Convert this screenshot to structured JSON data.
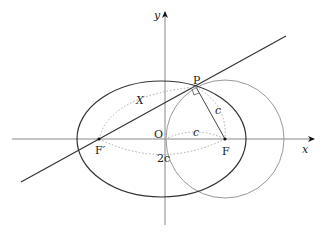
{
  "diagram": {
    "type": "ellipse-focal-geometry",
    "axes": {
      "x_label": "x",
      "y_label": "y",
      "origin_label": "O"
    },
    "points": {
      "P": "P",
      "F": "F",
      "F_prime": "F′"
    },
    "annotations": {
      "X": "X",
      "c_PF": "c",
      "c_OF": "c",
      "two_c": "2c"
    },
    "colors": {
      "ellipse": "#333333",
      "circle": "#888888",
      "axes": "#777777",
      "line": "#333333",
      "dotted": "#aaaaaa"
    }
  }
}
